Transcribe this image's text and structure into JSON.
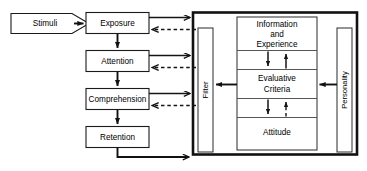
{
  "diagram": {
    "type": "flow-diagram",
    "canvas": {
      "width": 367,
      "height": 171
    },
    "colors": {
      "background": "#ffffff",
      "stroke": "#111111",
      "box_fill": "#ffffff",
      "divider": "#555555"
    }
  },
  "nodes": {
    "stimuli": {
      "label": "Stimuli",
      "shape": "pentagon-tag"
    },
    "exposure": {
      "label": "Exposure",
      "shape": "rect"
    },
    "attention": {
      "label": "Attention",
      "shape": "rect"
    },
    "comprehension": {
      "label": "Comprehension",
      "shape": "rect"
    },
    "retention": {
      "label": "Retention",
      "shape": "rect"
    },
    "filter": {
      "label": "Filter",
      "shape": "rect-vertical",
      "orientation": "vertical"
    },
    "personality": {
      "label": "Personality",
      "shape": "rect-vertical",
      "orientation": "vertical"
    },
    "information_and_experience": {
      "label": "Information and Experience",
      "line1": "Information",
      "line2": "and",
      "line3": "Experience",
      "shape": "rect"
    },
    "evaluative_criteria": {
      "label": "Evaluative Criteria",
      "line1": "Evaluative",
      "line2": "Criteria",
      "shape": "rect"
    },
    "attitude": {
      "label": "Attitude",
      "shape": "rect"
    }
  },
  "edges": [
    {
      "from": "stimuli",
      "to": "exposure",
      "style": "solid",
      "direction": "right"
    },
    {
      "from": "exposure",
      "to": "attention",
      "style": "solid",
      "direction": "down"
    },
    {
      "from": "attention",
      "to": "comprehension",
      "style": "solid",
      "direction": "down"
    },
    {
      "from": "comprehension",
      "to": "retention",
      "style": "solid",
      "direction": "down"
    },
    {
      "from": "exposure",
      "to": "filter",
      "style": "solid",
      "direction": "right"
    },
    {
      "from": "filter",
      "to": "exposure",
      "style": "dashed",
      "direction": "left"
    },
    {
      "from": "attention",
      "to": "filter",
      "style": "solid",
      "direction": "right"
    },
    {
      "from": "filter",
      "to": "attention",
      "style": "dashed",
      "direction": "left"
    },
    {
      "from": "comprehension",
      "to": "filter",
      "style": "solid",
      "direction": "right"
    },
    {
      "from": "filter",
      "to": "comprehension",
      "style": "dashed",
      "direction": "left"
    },
    {
      "from": "retention",
      "to": "frame",
      "style": "solid",
      "direction": "right"
    },
    {
      "from": "evaluative_criteria",
      "to": "filter",
      "style": "solid",
      "direction": "left"
    },
    {
      "from": "personality",
      "to": "evaluative_criteria",
      "style": "solid",
      "direction": "left"
    },
    {
      "from": "information_and_experience",
      "to": "evaluative_criteria",
      "style": "solid",
      "direction": "down"
    },
    {
      "from": "evaluative_criteria",
      "to": "information_and_experience",
      "style": "solid",
      "direction": "up"
    },
    {
      "from": "evaluative_criteria",
      "to": "attitude",
      "style": "solid",
      "direction": "down"
    },
    {
      "from": "attitude",
      "to": "evaluative_criteria",
      "style": "dashed",
      "direction": "up"
    }
  ]
}
